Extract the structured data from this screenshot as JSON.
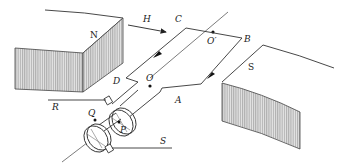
{
  "figure": {
    "magnets": {
      "north_label": "N",
      "south_label": "S"
    },
    "field_label": "H",
    "coil_labels": {
      "a": "A",
      "b": "B",
      "c": "C",
      "d": "D"
    },
    "axis_labels": {
      "o": "O",
      "o_prime": "O′"
    },
    "slip_ring_labels": {
      "p": "P",
      "q": "Q"
    },
    "terminal_labels": {
      "r": "R",
      "s": "S"
    },
    "colors": {
      "line": "#333333",
      "hatch": "#9a9a9a",
      "background": "#ffffff"
    }
  }
}
